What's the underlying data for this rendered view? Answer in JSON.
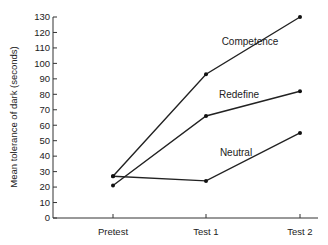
{
  "chart_data": {
    "type": "line",
    "title": "",
    "xlabel": "",
    "ylabel": "Mean tolerance of dark (seconds)",
    "categories": [
      "Pretest",
      "Test 1",
      "Test 2"
    ],
    "ylim": [
      0,
      130
    ],
    "yticks": [
      0,
      10,
      20,
      30,
      40,
      50,
      60,
      70,
      80,
      90,
      100,
      110,
      120,
      130
    ],
    "grid": false,
    "legend": "inline labels",
    "series": [
      {
        "name": "Competence",
        "values": [
          27,
          93,
          130
        ]
      },
      {
        "name": "Redefine",
        "values": [
          21,
          66,
          82
        ]
      },
      {
        "name": "Neutral",
        "values": [
          27,
          24,
          55
        ]
      }
    ]
  }
}
